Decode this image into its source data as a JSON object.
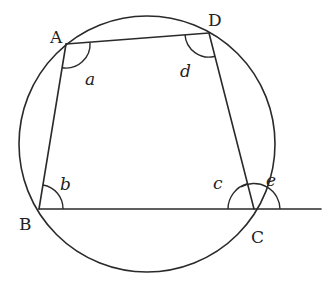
{
  "diagram": {
    "circle": {
      "cx": 147,
      "cy": 144,
      "r": 128
    },
    "points": {
      "A": {
        "label": "A",
        "x": 66,
        "y": 44
      },
      "B": {
        "label": "B",
        "x": 39,
        "y": 209
      },
      "C": {
        "label": "C",
        "x": 254,
        "y": 209
      },
      "D": {
        "label": "D",
        "x": 209,
        "y": 33
      }
    },
    "extension": {
      "from": "C",
      "to_x": 321,
      "to_y": 209
    },
    "angles": {
      "a": {
        "label": "a",
        "vertex": "A"
      },
      "b": {
        "label": "b",
        "vertex": "B"
      },
      "c": {
        "label": "c",
        "vertex": "C",
        "type": "interior"
      },
      "d": {
        "label": "d",
        "vertex": "D"
      },
      "e": {
        "label": "e",
        "vertex": "C",
        "type": "exterior"
      }
    },
    "colors": {
      "line": "#2a2a2a",
      "background": "#ffffff"
    }
  }
}
